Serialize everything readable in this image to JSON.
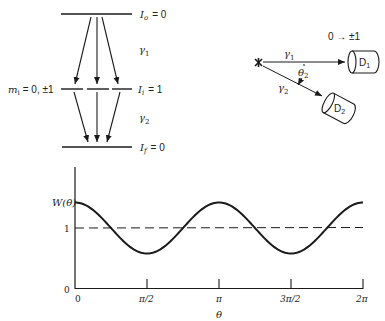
{
  "level_diagram": {
    "initial_level": {
      "symbol": "I",
      "sub": "o",
      "value": "= 0"
    },
    "intermediate_level": {
      "symbol": "I",
      "sub": "i",
      "value": "= 1"
    },
    "final_level": {
      "symbol": "I",
      "sub": "f",
      "value": "= 0"
    },
    "substate_label": {
      "symbol": "m",
      "sub": "i",
      "value": "= 0, ±1"
    },
    "gamma1": {
      "symbol": "γ",
      "sub": "1"
    },
    "gamma2": {
      "symbol": "γ",
      "sub": "2"
    }
  },
  "detector_diagram": {
    "transition_label": "0 → ±1",
    "gamma1": {
      "symbol": "γ",
      "sub": "1"
    },
    "gamma2": {
      "symbol": "γ",
      "sub": "2"
    },
    "angle": {
      "symbol": "θ",
      "sub": "2"
    },
    "detector1": {
      "symbol": "D",
      "sub": "1"
    },
    "detector2": {
      "symbol": "D",
      "sub": "2"
    }
  },
  "chart_data": {
    "type": "line",
    "title": "",
    "xlabel": "θ",
    "ylabel": "W(θ)",
    "x_ticks": [
      "0",
      "π/2",
      "π",
      "3π/2",
      "2π"
    ],
    "y_ticks": [
      "0",
      "1"
    ],
    "xlim": [
      0,
      6.2832
    ],
    "ylim": [
      0,
      1.8
    ],
    "series": [
      {
        "name": "W(θ)",
        "style": "solid",
        "description": "1 + a·cos(2θ), a≈0.35",
        "x": [
          0,
          0.7854,
          1.5708,
          2.3562,
          3.1416,
          3.927,
          4.7124,
          5.4978,
          6.2832
        ],
        "y": [
          1.35,
          1.0,
          0.65,
          1.0,
          1.35,
          1.0,
          0.65,
          1.0,
          1.35
        ]
      },
      {
        "name": "isotropic",
        "style": "dashed",
        "x": [
          0,
          6.2832
        ],
        "y": [
          1,
          1
        ]
      }
    ],
    "grid": false,
    "legend": null
  }
}
